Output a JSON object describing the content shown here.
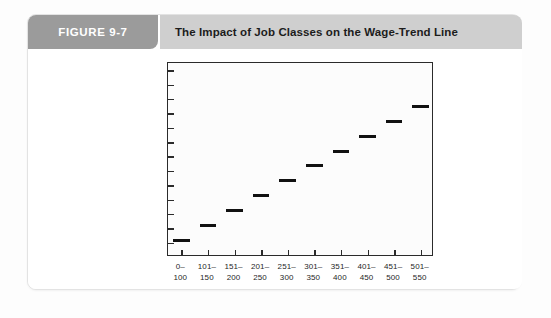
{
  "figure": {
    "number_label": "FIGURE 9-7",
    "title": "The Impact of Job Classes on the Wage-Trend Line"
  },
  "colors": {
    "figure_number_bg": "#9b9b9b",
    "figure_title_bg": "#cfcfcf",
    "card_bg": "#ffffff",
    "card_border": "#e3e3e3",
    "axis": "#2b2b2b",
    "bar": "#111111",
    "page_bg": "#fdfdfd",
    "title_text": "#1c1c1c",
    "number_text": "#ffffff"
  },
  "chart_data": {
    "type": "bar",
    "title": "The Impact of Job Classes on the Wage-Trend Line",
    "xlabel": "",
    "ylabel": "Amount, $",
    "categories": [
      "0–100",
      "101–150",
      "151–200",
      "201–250",
      "251–300",
      "301–350",
      "351–400",
      "401–450",
      "451–500",
      "501–550"
    ],
    "category_lines": [
      [
        "0–",
        "100"
      ],
      [
        "101–",
        "150"
      ],
      [
        "151–",
        "200"
      ],
      [
        "201–",
        "250"
      ],
      [
        "251–",
        "300"
      ],
      [
        "301–",
        "350"
      ],
      [
        "351–",
        "400"
      ],
      [
        "401–",
        "450"
      ],
      [
        "451–",
        "500"
      ],
      [
        "501–",
        "550"
      ]
    ],
    "values": [
      1,
      2,
      3,
      4,
      5,
      6,
      7,
      8,
      9,
      10
    ],
    "ylim": [
      0,
      13
    ],
    "y_tick_count": 13,
    "y_ticks_labeled": false,
    "x_tick_count": 10,
    "grid": false,
    "legend": false,
    "note": "Step (staircase) chart: each job class range is drawn as a short flat horizontal bar, each step rising equally above the previous one, forming an ascending wage-trend line."
  }
}
